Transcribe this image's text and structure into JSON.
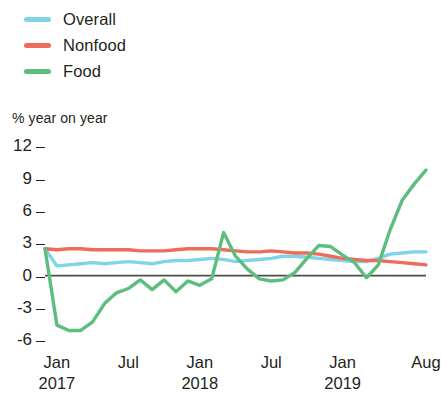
{
  "legend": {
    "position": "top-left",
    "items": [
      {
        "label": "Overall",
        "color": "#7fd4e8",
        "name": "overall"
      },
      {
        "label": "Nonfood",
        "color": "#ef6b5a",
        "name": "nonfood"
      },
      {
        "label": "Food",
        "color": "#5cbe7e",
        "name": "food"
      }
    ]
  },
  "axis": {
    "y_title": "% year on year",
    "y_ticks": [
      "12",
      "9",
      "6",
      "3",
      "0",
      "-3",
      "-6"
    ],
    "x_ticks": [
      {
        "label": "Jan",
        "year": "2017"
      },
      {
        "label": "Jul",
        "year": ""
      },
      {
        "label": "Jan",
        "year": "2018"
      },
      {
        "label": "Jul",
        "year": ""
      },
      {
        "label": "Jan",
        "year": "2019"
      },
      {
        "label": "Aug",
        "year": ""
      }
    ]
  },
  "chart_data": {
    "type": "line",
    "title": "",
    "subtitle": "",
    "xlabel": "",
    "ylabel": "% year on year",
    "ylim": [
      -7,
      12
    ],
    "xlim": [
      0,
      32
    ],
    "grid": false,
    "legend_position": "top-left",
    "baseline": 0,
    "x_tick_values": [
      1,
      7,
      13,
      19,
      25,
      32
    ],
    "x_tick_labels": [
      "Jan 2017",
      "Jul",
      "Jan 2018",
      "Jul",
      "Jan 2019",
      "Aug"
    ],
    "y_tick_values": [
      12,
      9,
      6,
      3,
      0,
      -3,
      -6
    ],
    "x": [
      0,
      1,
      2,
      3,
      4,
      5,
      6,
      7,
      8,
      9,
      10,
      11,
      12,
      13,
      14,
      15,
      16,
      17,
      18,
      19,
      20,
      21,
      22,
      23,
      24,
      25,
      26,
      27,
      28,
      29,
      30,
      31,
      32
    ],
    "series": [
      {
        "name": "Overall",
        "color": "#7fd4e8",
        "values": [
          2.5,
          0.9,
          1.0,
          1.1,
          1.2,
          1.1,
          1.2,
          1.3,
          1.2,
          1.1,
          1.3,
          1.4,
          1.4,
          1.5,
          1.6,
          1.5,
          1.3,
          1.4,
          1.5,
          1.6,
          1.8,
          1.8,
          1.7,
          1.6,
          1.5,
          1.4,
          1.3,
          1.3,
          1.6,
          2.0,
          2.1,
          2.2,
          2.2
        ]
      },
      {
        "name": "Nonfood",
        "color": "#ef6b5a",
        "values": [
          2.5,
          2.4,
          2.5,
          2.5,
          2.4,
          2.4,
          2.4,
          2.4,
          2.3,
          2.3,
          2.3,
          2.4,
          2.5,
          2.5,
          2.5,
          2.4,
          2.3,
          2.2,
          2.2,
          2.3,
          2.2,
          2.1,
          2.1,
          2.0,
          1.8,
          1.6,
          1.5,
          1.4,
          1.4,
          1.3,
          1.2,
          1.1,
          1.0
        ]
      },
      {
        "name": "Food",
        "color": "#5cbe7e",
        "values": [
          2.5,
          -4.6,
          -5.1,
          -5.1,
          -4.3,
          -2.6,
          -1.6,
          -1.2,
          -0.4,
          -1.3,
          -0.4,
          -1.5,
          -0.5,
          -0.9,
          -0.3,
          4.0,
          1.8,
          0.6,
          -0.3,
          -0.5,
          -0.4,
          0.3,
          1.6,
          2.8,
          2.7,
          1.9,
          1.2,
          -0.2,
          1.0,
          4.3,
          7.0,
          8.5,
          9.8
        ]
      }
    ]
  }
}
